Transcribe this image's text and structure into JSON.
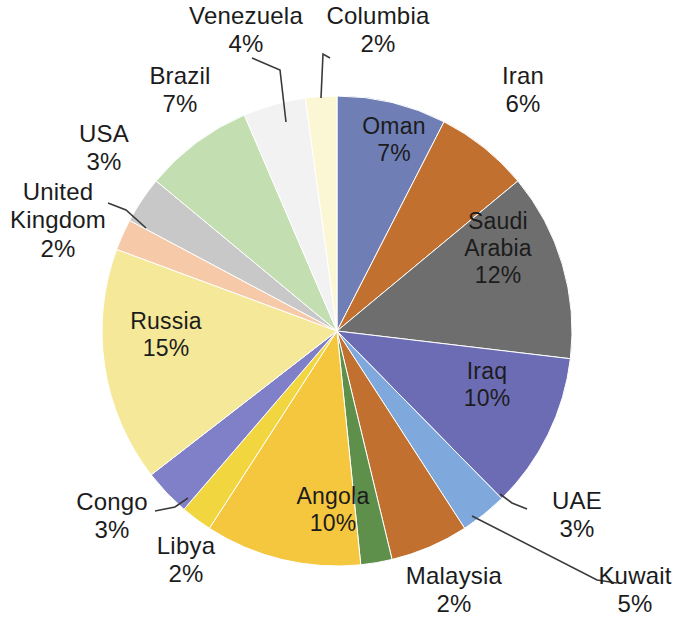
{
  "chart_data": {
    "type": "pie",
    "title": "",
    "subtitle": "",
    "xlabel": "",
    "ylabel": "",
    "legend_position": "none",
    "grid": false,
    "units": "percent",
    "start_angle_deg": 0,
    "direction": "clockwise",
    "categories": [
      "Oman",
      "Iran",
      "Saudi Arabia",
      "Iraq",
      "UAE",
      "Kuwait",
      "Malaysia",
      "Angola",
      "Libya",
      "Congo",
      "Russia",
      "United Kingdom",
      "USA",
      "Brazil",
      "Venezuela",
      "Columbia"
    ],
    "values": [
      7,
      6,
      12,
      10,
      3,
      5,
      2,
      10,
      2,
      3,
      15,
      2,
      3,
      7,
      4,
      2
    ],
    "colors": [
      "#6F7FB5",
      "#C1702F",
      "#6E6E6E",
      "#6C6CB5",
      "#7FA8DC",
      "#C1702F",
      "#5E8F4B",
      "#F5C73E",
      "#F2D63F",
      "#8080C8",
      "#F5E999",
      "#F6C9A8",
      "#C8C8C8",
      "#C3DEB0",
      "#F2F2F2",
      "#FBF7D5"
    ],
    "slices": [
      {
        "label": "Oman",
        "value": 7,
        "display": "7%",
        "color": "#6F7FB5",
        "label_placement": "inside"
      },
      {
        "label": "Iran",
        "value": 6,
        "display": "6%",
        "color": "#C1702F",
        "label_placement": "outside"
      },
      {
        "label": "Saudi Arabia",
        "value": 12,
        "display": "12%",
        "color": "#6E6E6E",
        "label_placement": "inside"
      },
      {
        "label": "Iraq",
        "value": 10,
        "display": "10%",
        "color": "#6C6CB5",
        "label_placement": "inside"
      },
      {
        "label": "UAE",
        "value": 3,
        "display": "3%",
        "color": "#7FA8DC",
        "label_placement": "outside"
      },
      {
        "label": "Kuwait",
        "value": 5,
        "display": "5%",
        "color": "#C1702F",
        "label_placement": "outside"
      },
      {
        "label": "Malaysia",
        "value": 2,
        "display": "2%",
        "color": "#5E8F4B",
        "label_placement": "outside"
      },
      {
        "label": "Angola",
        "value": 10,
        "display": "10%",
        "color": "#F5C73E",
        "label_placement": "inside"
      },
      {
        "label": "Libya",
        "value": 2,
        "display": "2%",
        "color": "#F2D63F",
        "label_placement": "outside"
      },
      {
        "label": "Congo",
        "value": 3,
        "display": "3%",
        "color": "#8080C8",
        "label_placement": "outside"
      },
      {
        "label": "Russia",
        "value": 15,
        "display": "15%",
        "color": "#F5E999",
        "label_placement": "inside"
      },
      {
        "label": "United Kingdom",
        "value": 2,
        "display": "2%",
        "color": "#F6C9A8",
        "label_placement": "outside"
      },
      {
        "label": "USA",
        "value": 3,
        "display": "3%",
        "color": "#C8C8C8",
        "label_placement": "outside"
      },
      {
        "label": "Brazil",
        "value": 7,
        "display": "7%",
        "color": "#C3DEB0",
        "label_placement": "outside"
      },
      {
        "label": "Venezuela",
        "value": 4,
        "display": "4%",
        "color": "#F2F2F2",
        "label_placement": "outside"
      },
      {
        "label": "Columbia",
        "value": 2,
        "display": "2%",
        "color": "#FBF7D5",
        "label_placement": "outside"
      }
    ]
  },
  "labels": {
    "oman": {
      "name": "Oman",
      "pct": "7%"
    },
    "iran": {
      "name": "Iran",
      "pct": "6%"
    },
    "saudi_arabia_1": {
      "name": "Saudi",
      "pct": ""
    },
    "saudi_arabia_2": {
      "name": "Arabia",
      "pct": "12%"
    },
    "iraq": {
      "name": "Iraq",
      "pct": "10%"
    },
    "uae": {
      "name": "UAE",
      "pct": "3%"
    },
    "kuwait": {
      "name": "Kuwait",
      "pct": "5%"
    },
    "malaysia": {
      "name": "Malaysia",
      "pct": "2%"
    },
    "angola": {
      "name": "Angola",
      "pct": "10%"
    },
    "libya": {
      "name": "Libya",
      "pct": "2%"
    },
    "congo": {
      "name": "Congo",
      "pct": "3%"
    },
    "russia": {
      "name": "Russia",
      "pct": "15%"
    },
    "uk_1": {
      "name": "United",
      "pct": ""
    },
    "uk_2": {
      "name": "Kingdom",
      "pct": "2%"
    },
    "usa": {
      "name": "USA",
      "pct": "3%"
    },
    "brazil": {
      "name": "Brazil",
      "pct": "7%"
    },
    "venezuela": {
      "name": "Venezuela",
      "pct": "4%"
    },
    "columbia": {
      "name": "Columbia",
      "pct": "2%"
    }
  }
}
